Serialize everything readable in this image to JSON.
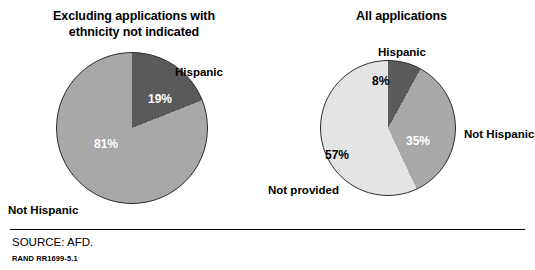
{
  "figure": {
    "source_note": "SOURCE: AFD.",
    "report_id": "RAND RR1699-5.1"
  },
  "chart_data": [
    {
      "type": "pie",
      "title": "Excluding applications with ethnicity not indicated",
      "title_line1": "Excluding applications with",
      "title_line2": "ethnicity not indicated",
      "categories": [
        "Hispanic",
        "Not Hispanic"
      ],
      "values": [
        19,
        81
      ],
      "value_labels": [
        "19%",
        "81%"
      ],
      "colors": [
        "#5a5a5a",
        "#a8a8a8"
      ],
      "start_angle_deg": 0,
      "label_positions": [
        "outside-right",
        "outside-bottom-left"
      ]
    },
    {
      "type": "pie",
      "title": "All applications",
      "title_line1": "All applications",
      "title_line2": "",
      "categories": [
        "Hispanic",
        "Not Hispanic",
        "Not provided"
      ],
      "values": [
        8,
        35,
        57
      ],
      "value_labels": [
        "8%",
        "35%",
        "57%"
      ],
      "colors": [
        "#5a5a5a",
        "#a8a8a8",
        "#e4e4e4"
      ],
      "start_angle_deg": 0,
      "label_positions": [
        "outside-top",
        "outside-right",
        "outside-bottom-left"
      ]
    }
  ]
}
